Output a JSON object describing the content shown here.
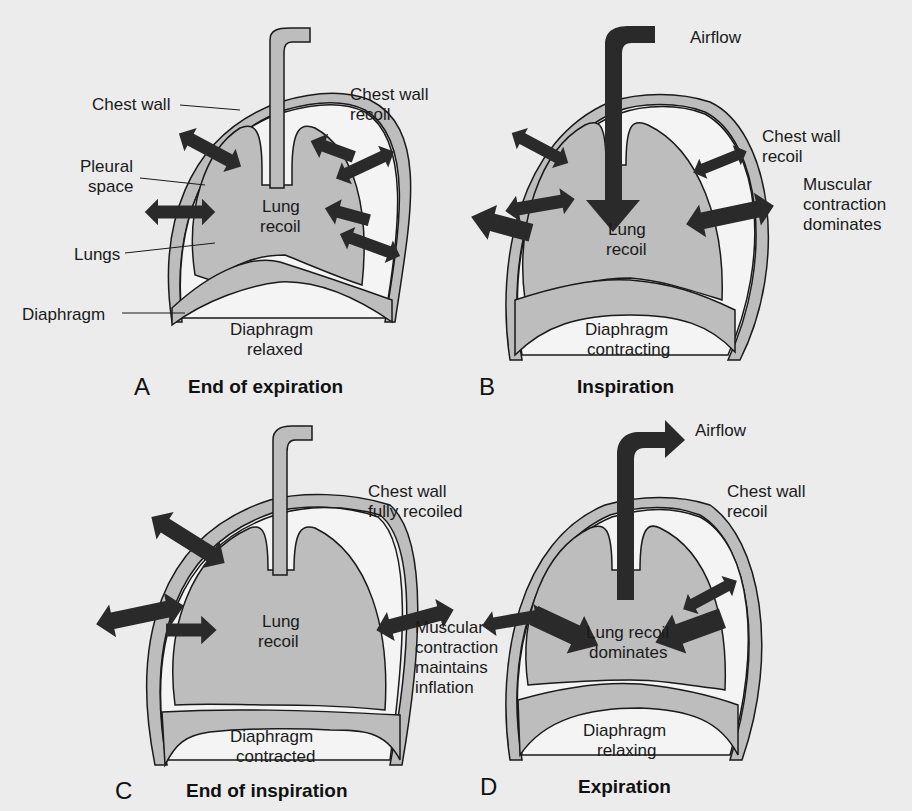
{
  "figure": {
    "panels": [
      {
        "letter": "A",
        "caption": "End of expiration",
        "labels": {
          "chest_wall": "Chest wall",
          "chest_wall_recoil_1": "Chest wall",
          "chest_wall_recoil_2": "recoil",
          "pleural_space_1": "Pleural",
          "pleural_space_2": "space",
          "lungs": "Lungs",
          "lung_recoil_1": "Lung",
          "lung_recoil_2": "recoil",
          "diaphragm": "Diaphragm",
          "diaphragm_state_1": "Diaphragm",
          "diaphragm_state_2": "relaxed"
        }
      },
      {
        "letter": "B",
        "caption": "Inspiration",
        "labels": {
          "airflow": "Airflow",
          "chest_wall_recoil_1": "Chest wall",
          "chest_wall_recoil_2": "recoil",
          "muscular_1": "Muscular",
          "muscular_2": "contraction",
          "muscular_3": "dominates",
          "lung_recoil_1": "Lung",
          "lung_recoil_2": "recoil",
          "diaphragm_state_1": "Diaphragm",
          "diaphragm_state_2": "contracting"
        }
      },
      {
        "letter": "C",
        "caption": "End of inspiration",
        "labels": {
          "chest_wall_1": "Chest wall",
          "chest_wall_2": "fully recoiled",
          "muscular_1": "Muscular",
          "muscular_2": "contraction",
          "muscular_3": "maintains",
          "muscular_4": "inflation",
          "lung_recoil_1": "Lung",
          "lung_recoil_2": "recoil",
          "diaphragm_state_1": "Diaphragm",
          "diaphragm_state_2": "contracted"
        }
      },
      {
        "letter": "D",
        "caption": "Expiration",
        "labels": {
          "airflow": "Airflow",
          "chest_wall_recoil_1": "Chest wall",
          "chest_wall_recoil_2": "recoil",
          "lung_recoil_1": "Lung recoil",
          "lung_recoil_2": "dominates",
          "diaphragm_state_1": "Diaphragm",
          "diaphragm_state_2": "relaxing"
        }
      }
    ],
    "colors": {
      "background": "#ececec",
      "lung_fill": "#bdbdbd",
      "pleura_fill": "#f4f4f4",
      "arrow": "#2a2a2a",
      "outline": "#1a1a1a"
    }
  }
}
